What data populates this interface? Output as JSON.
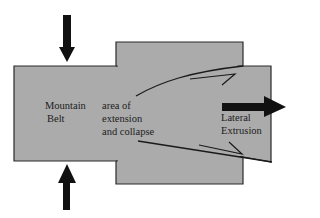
{
  "diagram": {
    "type": "tectonic-block-diagram",
    "colors": {
      "background": "#ffffff",
      "block_fill": "#ababab",
      "outline": "#2a2a2a",
      "arrows": "#111111",
      "text": "#1c1c1c"
    },
    "labels": {
      "mountain_belt_line1": "Mountain",
      "mountain_belt_line2": "Belt",
      "extension_line1": "area of",
      "extension_line2": "extension",
      "extension_line3": "and collapse",
      "lateral_line1": "Lateral",
      "lateral_line2": "Extrusion"
    },
    "arrows": [
      {
        "name": "compression-arrow-top",
        "direction": "down"
      },
      {
        "name": "compression-arrow-bottom",
        "direction": "up"
      },
      {
        "name": "extrusion-arrow",
        "direction": "right"
      }
    ],
    "faults": [
      {
        "name": "upper-strike-slip-fault",
        "sense": "right-lateral"
      },
      {
        "name": "lower-strike-slip-fault",
        "sense": "left-lateral"
      }
    ]
  }
}
